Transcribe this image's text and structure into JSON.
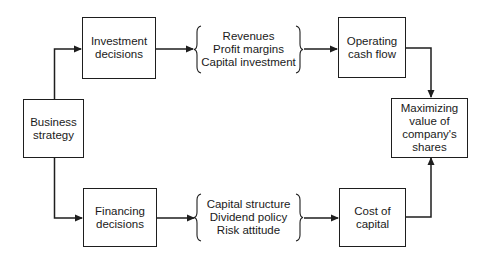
{
  "diagram": {
    "nodes": {
      "business_strategy": {
        "lines": [
          "Business",
          "strategy"
        ]
      },
      "investment_decisions": {
        "lines": [
          "Investment",
          "decisions"
        ]
      },
      "financing_decisions": {
        "lines": [
          "Financing",
          "decisions"
        ]
      },
      "operating_cash_flow": {
        "lines": [
          "Operating",
          "cash flow"
        ]
      },
      "cost_of_capital": {
        "lines": [
          "Cost of",
          "capital"
        ]
      },
      "maximizing_value": {
        "lines": [
          "Maximizing",
          "value of",
          "company's",
          "shares"
        ]
      }
    },
    "groups": {
      "investment_factors": {
        "lines": [
          "Revenues",
          "Profit margins",
          "Capital investment"
        ]
      },
      "financing_factors": {
        "lines": [
          "Capital structure",
          "Dividend policy",
          "Risk attitude"
        ]
      }
    },
    "edges": [
      {
        "from": "business_strategy",
        "to": "investment_decisions"
      },
      {
        "from": "business_strategy",
        "to": "financing_decisions"
      },
      {
        "from": "investment_decisions",
        "to": "investment_factors"
      },
      {
        "from": "investment_factors",
        "to": "operating_cash_flow"
      },
      {
        "from": "financing_decisions",
        "to": "financing_factors"
      },
      {
        "from": "financing_factors",
        "to": "cost_of_capital"
      },
      {
        "from": "operating_cash_flow",
        "to": "maximizing_value"
      },
      {
        "from": "cost_of_capital",
        "to": "maximizing_value"
      }
    ],
    "line_color": "#1e1e1e"
  }
}
